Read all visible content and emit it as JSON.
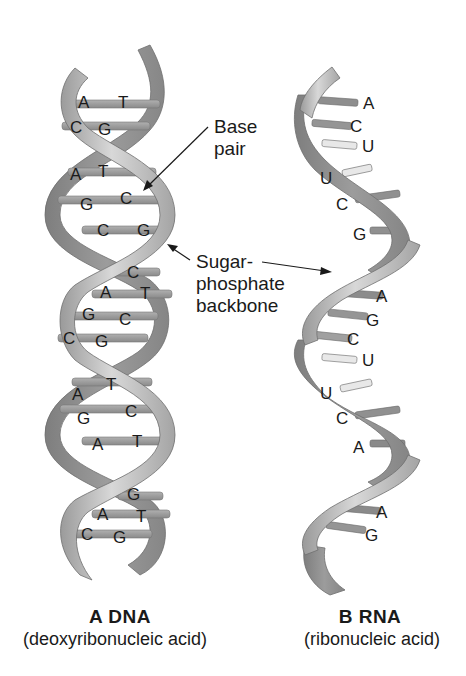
{
  "colors": {
    "background": "#ffffff",
    "backbone_light": "#c4c4c4",
    "backbone_mid": "#a9a9a9",
    "backbone_dark": "#8a8a8a",
    "rung_dark": "#8c8c8c",
    "rung_light": "#b8b8b8",
    "rung_uracil": "#e6e6e6",
    "text": "#1a1a1a"
  },
  "callouts": {
    "base_pair": {
      "line1": "Base",
      "line2": "pair"
    },
    "backbone": {
      "line1": "Sugar-",
      "line2": "phosphate",
      "line3": "backbone"
    }
  },
  "dna": {
    "label": "A",
    "title": "DNA",
    "caption_title": "A  DNA",
    "caption_sub": "(deoxyribonucleic acid)",
    "base_pairs": [
      {
        "left": "A",
        "right": "T"
      },
      {
        "left": "C",
        "right": "G"
      },
      {
        "left": "A",
        "right": "T"
      },
      {
        "left": "G",
        "right": "C"
      },
      {
        "left": "C",
        "right": "G"
      },
      {
        "left": "",
        "right": "C"
      },
      {
        "left": "A",
        "right": "T"
      },
      {
        "left": "G",
        "right": "C"
      },
      {
        "left": "C",
        "right": "G"
      },
      {
        "left": "A",
        "right": "T"
      },
      {
        "left": "G",
        "right": "C"
      },
      {
        "left": "A",
        "right": "T"
      },
      {
        "left": "",
        "right": "G"
      },
      {
        "left": "A",
        "right": "T"
      },
      {
        "left": "C",
        "right": "G"
      }
    ]
  },
  "rna": {
    "label": "B",
    "title": "RNA",
    "caption_title": "B  RNA",
    "caption_sub": "(ribonucleic acid)",
    "bases": [
      "A",
      "C",
      "U",
      "U",
      "C",
      "G",
      "A",
      "G",
      "C",
      "U",
      "U",
      "C",
      "A",
      "A",
      "G"
    ]
  }
}
